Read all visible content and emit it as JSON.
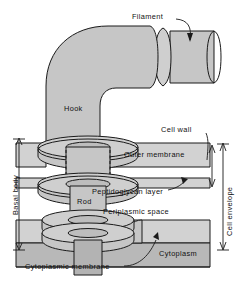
{
  "figure": {
    "type": "biological-diagram",
    "width": 236,
    "height": 287,
    "background": "#ffffff"
  },
  "colors": {
    "structure_fill": "#c6c6c6",
    "structure_fill_light": "#d4d4d4",
    "structure_fill_dark": "#b0b0b0",
    "cytoplasm_fill": "#b8b8b8",
    "layer_fill": "#d2d2d2",
    "outline": "#1a1a1a",
    "text": "#111111"
  },
  "labels": {
    "filament": "Filament",
    "hook": "Hook",
    "cell_wall": "Cell wall",
    "outer_membrane": "Outer membrane",
    "peptidoglycan_layer": "Peptidoglycan layer",
    "periplasmic_space": "Periplasmic space",
    "rod": "Rod",
    "cytoplasm": "Cytoplasm",
    "cytoplasmic_membrane": "Cytoplasmic membrane",
    "basal_body": "Basal body",
    "cell_envelope": "Cell envelope"
  },
  "parts": [
    {
      "id": "filament",
      "label": "Filament",
      "callout": true
    },
    {
      "id": "hook",
      "label": "Hook",
      "callout": false
    },
    {
      "id": "cell-wall",
      "label": "Cell wall",
      "callout": true
    },
    {
      "id": "outer-membrane",
      "label": "Outer membrane",
      "callout": false
    },
    {
      "id": "peptidoglycan-layer",
      "label": "Peptidoglycan layer",
      "callout": true
    },
    {
      "id": "periplasmic-space",
      "label": "Periplasmic space",
      "callout": false
    },
    {
      "id": "rod",
      "label": "Rod",
      "callout": false
    },
    {
      "id": "cytoplasm",
      "label": "Cytoplasm",
      "callout": false
    },
    {
      "id": "cytoplasmic-membrane",
      "label": "Cytoplasmic membrane",
      "callout": true
    }
  ],
  "brackets": [
    {
      "id": "basal-body",
      "label": "Basal body",
      "side": "left",
      "orientation": "vertical"
    },
    {
      "id": "cell-envelope",
      "label": "Cell envelope",
      "side": "right",
      "orientation": "vertical"
    },
    {
      "id": "cell-wall-bracket",
      "label": "Cell wall",
      "side": "right",
      "orientation": "vertical"
    }
  ]
}
